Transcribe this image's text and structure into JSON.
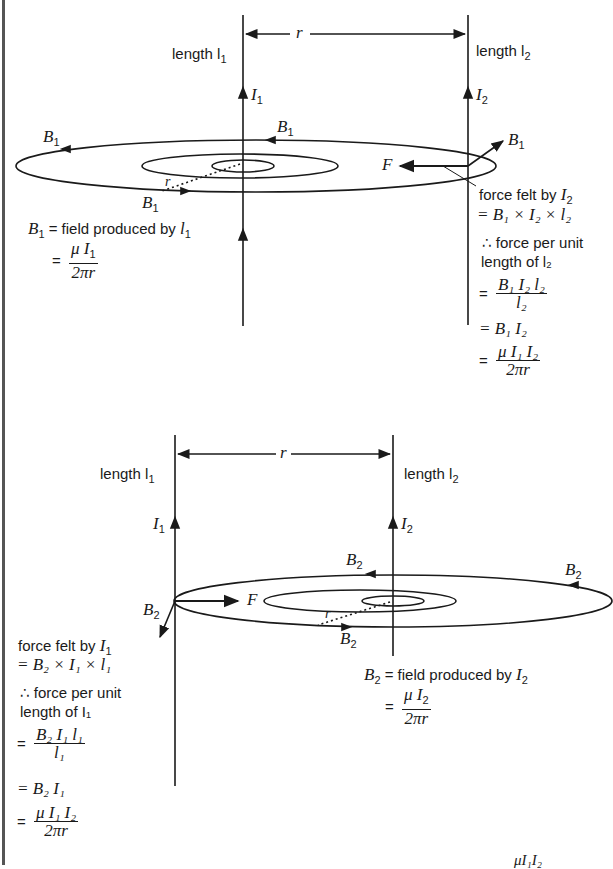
{
  "diagram": {
    "colors": {
      "line": "#1a1a1a",
      "frame": "#555555",
      "background": "#ffffff"
    },
    "top_panel": {
      "wire1_label": "length l",
      "wire1_label_sub": "1",
      "wire2_label": "length l",
      "wire2_label_sub": "2",
      "separation": "r",
      "current1": "I",
      "current1_sub": "1",
      "current2": "I",
      "current2_sub": "2",
      "field_label": "B",
      "field_label_sub": "1",
      "force_label": "F",
      "radius_label": "r",
      "field_def": {
        "line1": "= field produced by ",
        "var": "B",
        "var_sub": "1",
        "by_var": "l",
        "by_sub": "1",
        "eq": "=",
        "num": "μ I",
        "num_sub": "1",
        "den": "2πr"
      },
      "force_text": {
        "line1": "force felt by ",
        "line1_var": "I",
        "line1_sub": "2",
        "line2": "= B₁ × I₂ × l₂",
        "line3": "∴ force per unit",
        "line4": "length of l₂",
        "step1_num": "B₁ I₂ l₂",
        "step1_den": "l₂",
        "step2": "= B₁ I₂",
        "step3_num": "μ I₁ I₂",
        "step3_den": "2πr",
        "eq": "="
      }
    },
    "bottom_panel": {
      "wire1_label": "length l",
      "wire1_label_sub": "1",
      "wire2_label": "length l",
      "wire2_label_sub": "2",
      "separation": "r",
      "current1": "I",
      "current1_sub": "1",
      "current2": "I",
      "current2_sub": "2",
      "field_label": "B",
      "field_label_sub": "2",
      "force_label": "F",
      "radius_label": "r",
      "field_def": {
        "line1": "= field produced by ",
        "var": "B",
        "var_sub": "2",
        "by_var": "I",
        "by_sub": "2",
        "eq": "=",
        "num": "μ I",
        "num_sub": "2",
        "den": "2πr"
      },
      "force_text": {
        "line1": "force felt by ",
        "line1_var": "I",
        "line1_sub": "1",
        "line2": "= B₂ × I₁ × l₁",
        "line3": "∴ force per unit",
        "line4": "length of I₁",
        "step1_num": "B₂ I₁ l₁",
        "step1_den": "l₁",
        "step2": "= B₂ I₁",
        "step3_num": "μ I₁ I₂",
        "step3_den": "2πr",
        "eq": "="
      }
    },
    "footer_partial": "μI₁I₂"
  }
}
